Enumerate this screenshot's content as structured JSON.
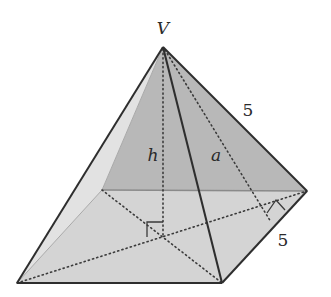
{
  "diagram": {
    "type": "square-pyramid",
    "labels": {
      "apex": "V",
      "height": "h",
      "slant_height": "a",
      "lateral_edge": "5",
      "base_edge": "5"
    },
    "colors": {
      "background": "#ffffff",
      "back_faces": "#b8b8b8",
      "left_face": "#e2e2e2",
      "base": "#d4d4d4",
      "edge": "#2e2e2e",
      "dotted": "#3a3a3a"
    },
    "points": {
      "apex": [
        163,
        47
      ],
      "front_left": [
        17,
        283
      ],
      "front_right": [
        222,
        283
      ],
      "back_right": [
        307,
        191
      ],
      "back_left": [
        102,
        190
      ],
      "base_center": [
        163,
        236
      ],
      "slant_foot": [
        271,
        222
      ]
    }
  }
}
